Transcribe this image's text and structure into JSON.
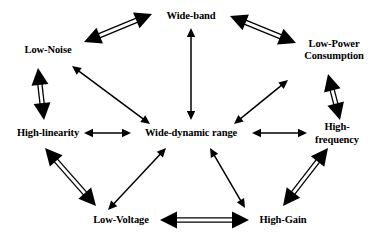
{
  "diagram": {
    "center_node": {
      "id": "wide-dynamic-range",
      "label": "Wide-dynamic range",
      "x": 191,
      "y": 133
    },
    "nodes": [
      {
        "id": "wide-band",
        "label": "Wide-band",
        "x": 191,
        "y": 16,
        "lines": 1
      },
      {
        "id": "low-power-consumption",
        "label": "Low-Power\nConsumption",
        "x": 334,
        "y": 50,
        "lines": 2
      },
      {
        "id": "high-frequency",
        "label": "High-frequency",
        "x": 337,
        "y": 133,
        "lines": 1
      },
      {
        "id": "high-gain",
        "label": "High-Gain",
        "x": 283,
        "y": 220,
        "lines": 1
      },
      {
        "id": "low-voltage",
        "label": "Low-Voltage",
        "x": 121,
        "y": 220,
        "lines": 1
      },
      {
        "id": "high-linearity",
        "label": "High-linearity",
        "x": 48,
        "y": 133,
        "lines": 1
      },
      {
        "id": "low-noise",
        "label": "Low-Noise",
        "x": 48,
        "y": 50,
        "lines": 1
      }
    ],
    "perimeter_edges": [
      {
        "id": "edge-low-noise-wide-band",
        "from": "low-noise",
        "to": "wide-band",
        "style": "thick-double-line",
        "heads": "both",
        "x1": 84,
        "y1": 42,
        "x2": 152,
        "y2": 14
      },
      {
        "id": "edge-wide-band-low-power",
        "from": "wide-band",
        "to": "low-power-consumption",
        "style": "thick-double-line",
        "heads": "both",
        "x1": 230,
        "y1": 16,
        "x2": 296,
        "y2": 43
      },
      {
        "id": "edge-low-power-high-frequency",
        "from": "low-power-consumption",
        "to": "high-frequency",
        "style": "thick-double-line",
        "heads": "both",
        "x1": 328,
        "y1": 74,
        "x2": 340,
        "y2": 120
      },
      {
        "id": "edge-high-frequency-high-gain",
        "from": "high-frequency",
        "to": "high-gain",
        "style": "thick-double-line",
        "heads": "both",
        "x1": 328,
        "y1": 148,
        "x2": 283,
        "y2": 206
      },
      {
        "id": "edge-high-gain-low-voltage",
        "from": "high-gain",
        "to": "low-voltage",
        "style": "thick-double-line",
        "heads": "both",
        "x1": 249,
        "y1": 220,
        "x2": 160,
        "y2": 220
      },
      {
        "id": "edge-low-voltage-high-linearity",
        "from": "low-voltage",
        "to": "high-linearity",
        "style": "thick-double-line",
        "heads": "both",
        "x1": 96,
        "y1": 206,
        "x2": 45,
        "y2": 148
      },
      {
        "id": "edge-high-linearity-low-noise",
        "from": "high-linearity",
        "to": "low-noise",
        "style": "thick-double-line",
        "heads": "both",
        "x1": 44,
        "y1": 120,
        "x2": 38,
        "y2": 68
      }
    ],
    "spoke_edges": [
      {
        "id": "spoke-wide-band-center",
        "from": "wide-band",
        "to": "wide-dynamic-range",
        "style": "thin-line",
        "heads": "both",
        "x1": 191,
        "y1": 28,
        "x2": 191,
        "y2": 120
      },
      {
        "id": "spoke-low-power-center",
        "from": "low-power-consumption",
        "to": "wide-dynamic-range",
        "style": "thin-line",
        "heads": "both",
        "x1": 288,
        "y1": 80,
        "x2": 234,
        "y2": 124
      },
      {
        "id": "spoke-high-frequency-center",
        "from": "high-frequency",
        "to": "wide-dynamic-range",
        "style": "thin-line",
        "heads": "both",
        "x1": 307,
        "y1": 133,
        "x2": 252,
        "y2": 133
      },
      {
        "id": "spoke-high-gain-center",
        "from": "high-gain",
        "to": "wide-dynamic-range",
        "style": "thin-line",
        "heads": "both",
        "x1": 245,
        "y1": 208,
        "x2": 210,
        "y2": 148
      },
      {
        "id": "spoke-low-voltage-center",
        "from": "low-voltage",
        "to": "wide-dynamic-range",
        "style": "thin-line",
        "heads": "both",
        "x1": 108,
        "y1": 210,
        "x2": 166,
        "y2": 148
      },
      {
        "id": "spoke-high-linearity-center",
        "from": "high-linearity",
        "to": "wide-dynamic-range",
        "style": "thin-line",
        "heads": "both",
        "x1": 84,
        "y1": 133,
        "x2": 131,
        "y2": 133
      },
      {
        "id": "spoke-low-noise-center",
        "from": "low-noise",
        "to": "wide-dynamic-range",
        "style": "thin-line",
        "heads": "both",
        "x1": 72,
        "y1": 66,
        "x2": 150,
        "y2": 124
      }
    ],
    "colors": {
      "stroke": "#000000",
      "background": "#ffffff",
      "text": "#000000"
    }
  }
}
